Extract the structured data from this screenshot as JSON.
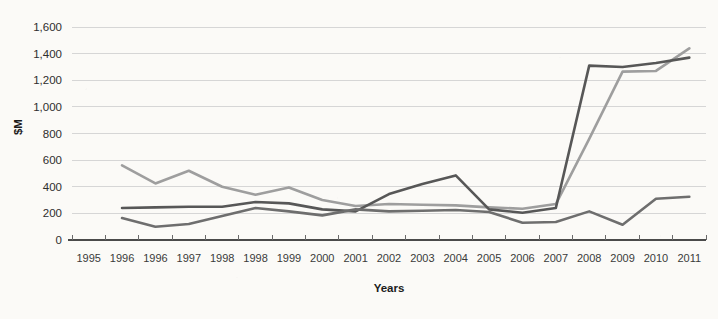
{
  "chart_data": {
    "type": "line",
    "title": "",
    "xlabel": "Years",
    "ylabel": "$M",
    "ylim": [
      0,
      1600
    ],
    "y_ticks": [
      "0",
      "200",
      "400",
      "600",
      "800",
      "1,000",
      "1,200",
      "1,400",
      "1,600"
    ],
    "y_tick_values": [
      0,
      200,
      400,
      600,
      800,
      1000,
      1200,
      1400,
      1600
    ],
    "grid": true,
    "legend": "none",
    "categories": [
      "1995",
      "1996",
      "1996",
      "1997",
      "1998",
      "1998",
      "1999",
      "2000",
      "2001",
      "2002",
      "2003",
      "2004",
      "2005",
      "2006",
      "2007",
      "2008",
      "2009",
      "2010",
      "2011"
    ],
    "series": [
      {
        "name": "series-light-gray",
        "color": "#9e9e9e",
        "start_index": 1,
        "values": [
          null,
          560,
          425,
          520,
          400,
          340,
          395,
          300,
          255,
          270,
          265,
          260,
          245,
          235,
          270,
          760,
          1265,
          1270,
          1440
        ]
      },
      {
        "name": "series-dark-gray",
        "color": "#575757",
        "start_index": 1,
        "values": [
          null,
          240,
          245,
          250,
          250,
          285,
          275,
          230,
          215,
          345,
          420,
          485,
          230,
          205,
          240,
          1310,
          1300,
          1330,
          1370
        ]
      },
      {
        "name": "series-medium-gray",
        "color": "#6e6e6e",
        "start_index": 1,
        "values": [
          null,
          165,
          100,
          120,
          180,
          240,
          215,
          185,
          230,
          215,
          220,
          225,
          210,
          130,
          135,
          215,
          115,
          310,
          325
        ]
      }
    ]
  },
  "axes": {
    "y_axis_title": "$M",
    "x_axis_title": "Years"
  },
  "colors": {
    "background": "#fbfaf7",
    "gridline": "#d6d6d6",
    "axis": "#4a4a4a",
    "text": "#2e2e2e",
    "series_light": "#9e9e9e",
    "series_dark": "#575757",
    "series_medium": "#6e6e6e"
  }
}
